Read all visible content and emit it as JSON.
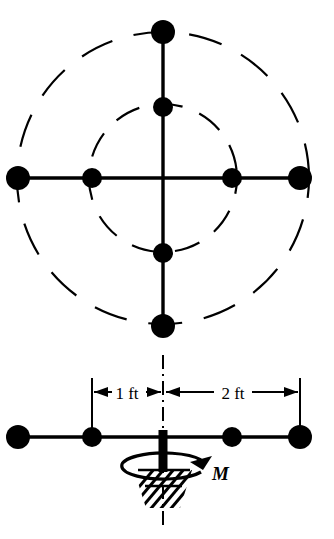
{
  "figure": {
    "type": "engineering-diagram",
    "background_color": "#ffffff",
    "ink_color": "#000000",
    "views": {
      "top": {
        "name": "top-view",
        "center": {
          "x": 163,
          "y": 178
        },
        "arms": [
          {
            "direction": "up",
            "length": 146
          },
          {
            "direction": "down",
            "length": 148
          },
          {
            "direction": "left",
            "length": 145
          },
          {
            "direction": "right",
            "length": 137
          }
        ],
        "spheres": [
          {
            "id": "top-outer",
            "cx": 163,
            "cy": 32,
            "r": 12
          },
          {
            "id": "top-inner",
            "cx": 163,
            "cy": 107,
            "r": 10
          },
          {
            "id": "left-outer",
            "cx": 18,
            "cy": 178,
            "r": 12
          },
          {
            "id": "left-inner",
            "cx": 92,
            "cy": 178,
            "r": 10
          },
          {
            "id": "right-inner",
            "cx": 232,
            "cy": 178,
            "r": 10
          },
          {
            "id": "right-outer",
            "cx": 300,
            "cy": 178,
            "r": 12
          },
          {
            "id": "bottom-inner",
            "cx": 163,
            "cy": 253,
            "r": 10
          },
          {
            "id": "bottom-outer",
            "cx": 163,
            "cy": 326,
            "r": 12
          }
        ],
        "reference_circles": [
          {
            "id": "inner-dashed-circle",
            "cx": 163,
            "cy": 178,
            "r": 74,
            "style": "dashed"
          },
          {
            "id": "outer-dashed-circle",
            "cx": 163,
            "cy": 178,
            "r": 146,
            "style": "dashed"
          }
        ]
      },
      "front": {
        "name": "front-view",
        "rod": {
          "x1": 18,
          "x2": 300,
          "y": 437
        },
        "spheres": [
          {
            "id": "front-left-outer",
            "cx": 18,
            "cy": 437,
            "r": 12
          },
          {
            "id": "front-left-inner",
            "cx": 92,
            "cy": 437,
            "r": 10
          },
          {
            "id": "front-right-inner",
            "cx": 232,
            "cy": 437,
            "r": 10
          },
          {
            "id": "front-right-outer",
            "cx": 300,
            "cy": 437,
            "r": 12
          }
        ],
        "shaft": {
          "x": 163,
          "y_top": 430,
          "y_bottom": 470,
          "width": 9
        },
        "centerline": {
          "x": 163,
          "y_top": 355,
          "y_bottom": 525,
          "style": "dash-dot"
        },
        "support": {
          "id": "fixed-support-hatching",
          "x": 163,
          "y": 470,
          "width": 62,
          "height": 38
        }
      }
    },
    "dimensions": [
      {
        "id": "dimension-1ft",
        "label": "1 ft",
        "value": 1,
        "unit": "ft",
        "from_x": 92,
        "to_x": 163,
        "y": 392,
        "label_x": 127,
        "label_y": 398
      },
      {
        "id": "dimension-2ft",
        "label": "2 ft",
        "value": 2,
        "unit": "ft",
        "from_x": 163,
        "to_x": 300,
        "y": 392,
        "label_x": 232,
        "label_y": 398
      }
    ],
    "extension_lines": [
      {
        "id": "ext-left",
        "x": 92,
        "y1": 378,
        "y2": 430
      },
      {
        "id": "ext-center",
        "x": 163,
        "y1": 362,
        "y2": 412
      },
      {
        "id": "ext-right",
        "x": 300,
        "y1": 378,
        "y2": 430
      }
    ],
    "annotations": [
      {
        "id": "moment-label",
        "label": "M",
        "meaning": "applied moment / torque",
        "x": 212,
        "y": 479
      },
      {
        "id": "torque-arrow",
        "meaning": "rotation direction arrow about vertical shaft",
        "cx": 163,
        "cy": 466,
        "rx": 42,
        "ry": 13
      }
    ]
  }
}
